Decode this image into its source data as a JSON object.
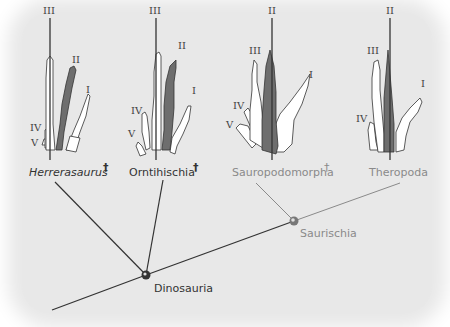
{
  "diagram": {
    "type": "cladogram",
    "taxa": [
      {
        "name": "Herrerasaurus",
        "italic": true,
        "extinct": true,
        "digits": [
          "III",
          "II",
          "I",
          "IV",
          "V"
        ],
        "axis_digit": "III",
        "color": "#333333"
      },
      {
        "name": "Orntihischia",
        "italic": false,
        "extinct": true,
        "digits": [
          "III",
          "II",
          "I",
          "IV",
          "V"
        ],
        "axis_digit": "III",
        "color": "#333333"
      },
      {
        "name": "Sauropodomorpha",
        "italic": false,
        "extinct": true,
        "digits": [
          "II",
          "III",
          "I",
          "IV",
          "V"
        ],
        "axis_digit": "II",
        "color": "#8a8a8a"
      },
      {
        "name": "Theropoda",
        "italic": false,
        "extinct": false,
        "digits": [
          "II",
          "III",
          "I",
          "IV"
        ],
        "axis_digit": "II",
        "color": "#8a8a8a"
      }
    ],
    "nodes": [
      {
        "name": "Dinosauria",
        "color": "#333333"
      },
      {
        "name": "Saurischia",
        "color": "#8a8a8a"
      }
    ],
    "extinct_symbol": "†",
    "colors": {
      "background": "#e8e8e8",
      "dark_line": "#333333",
      "light_line": "#8a8a8a",
      "shaded_digit": "#6e6e6e"
    }
  },
  "labels": {
    "herrerasaurus": "Herrerasaurus",
    "ornithischia": "Orntihischia",
    "sauropodomorpha": "Sauropodomorpha",
    "theropoda": "Theropoda",
    "dinosauria": "Dinosauria",
    "saurischia": "Saurischia",
    "dagger": "†",
    "d1": "I",
    "d2": "II",
    "d3": "III",
    "d4": "IV",
    "d5": "V"
  }
}
